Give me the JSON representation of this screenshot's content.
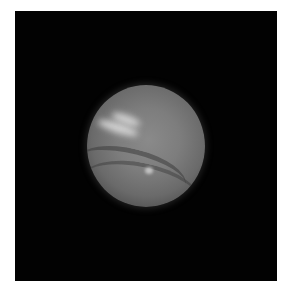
{
  "image": {
    "subject": "Neptune-like planet on black background",
    "alt": "Grayscale telescope image of a gas giant planet with bright cloud streaks",
    "colors": {
      "background": "#020202",
      "border": "#ffffff",
      "planet": "#7d7d7d",
      "clouds": "#e1e1e1"
    }
  }
}
